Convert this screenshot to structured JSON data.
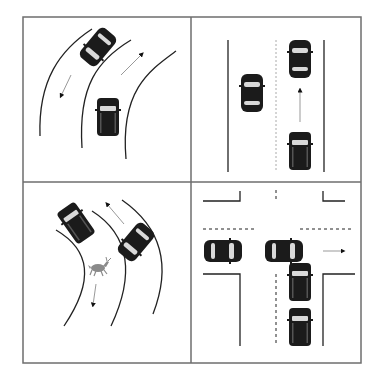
{
  "figure": {
    "grid": {
      "rows": 2,
      "cols": 2,
      "border_color": "#6e6e6e",
      "line_color": "#333333",
      "lane_line_color": "#9a9a9a"
    },
    "colors": {
      "car_body": "#1b1b1b",
      "car_glass": "#d9d9d9",
      "arrow": "#111111",
      "arrow_tail": "#9a9a9a",
      "animal": "#8a8a8a"
    }
  },
  "panels": [
    {
      "id": "top-left",
      "label": "curved road two-way traffic",
      "cars": 2,
      "arrows": [
        "down-left",
        "up-right"
      ]
    },
    {
      "id": "top-right",
      "label": "straight road overtaking",
      "cars": 3,
      "arrows": [
        "up"
      ]
    },
    {
      "id": "bottom-left",
      "label": "curved road with animal crossing",
      "cars": 2,
      "arrows": [
        "up-left",
        "down"
      ],
      "animal": "deer"
    },
    {
      "id": "bottom-right",
      "label": "intersection turning",
      "cars": 4,
      "arrows": [
        "right"
      ]
    }
  ]
}
